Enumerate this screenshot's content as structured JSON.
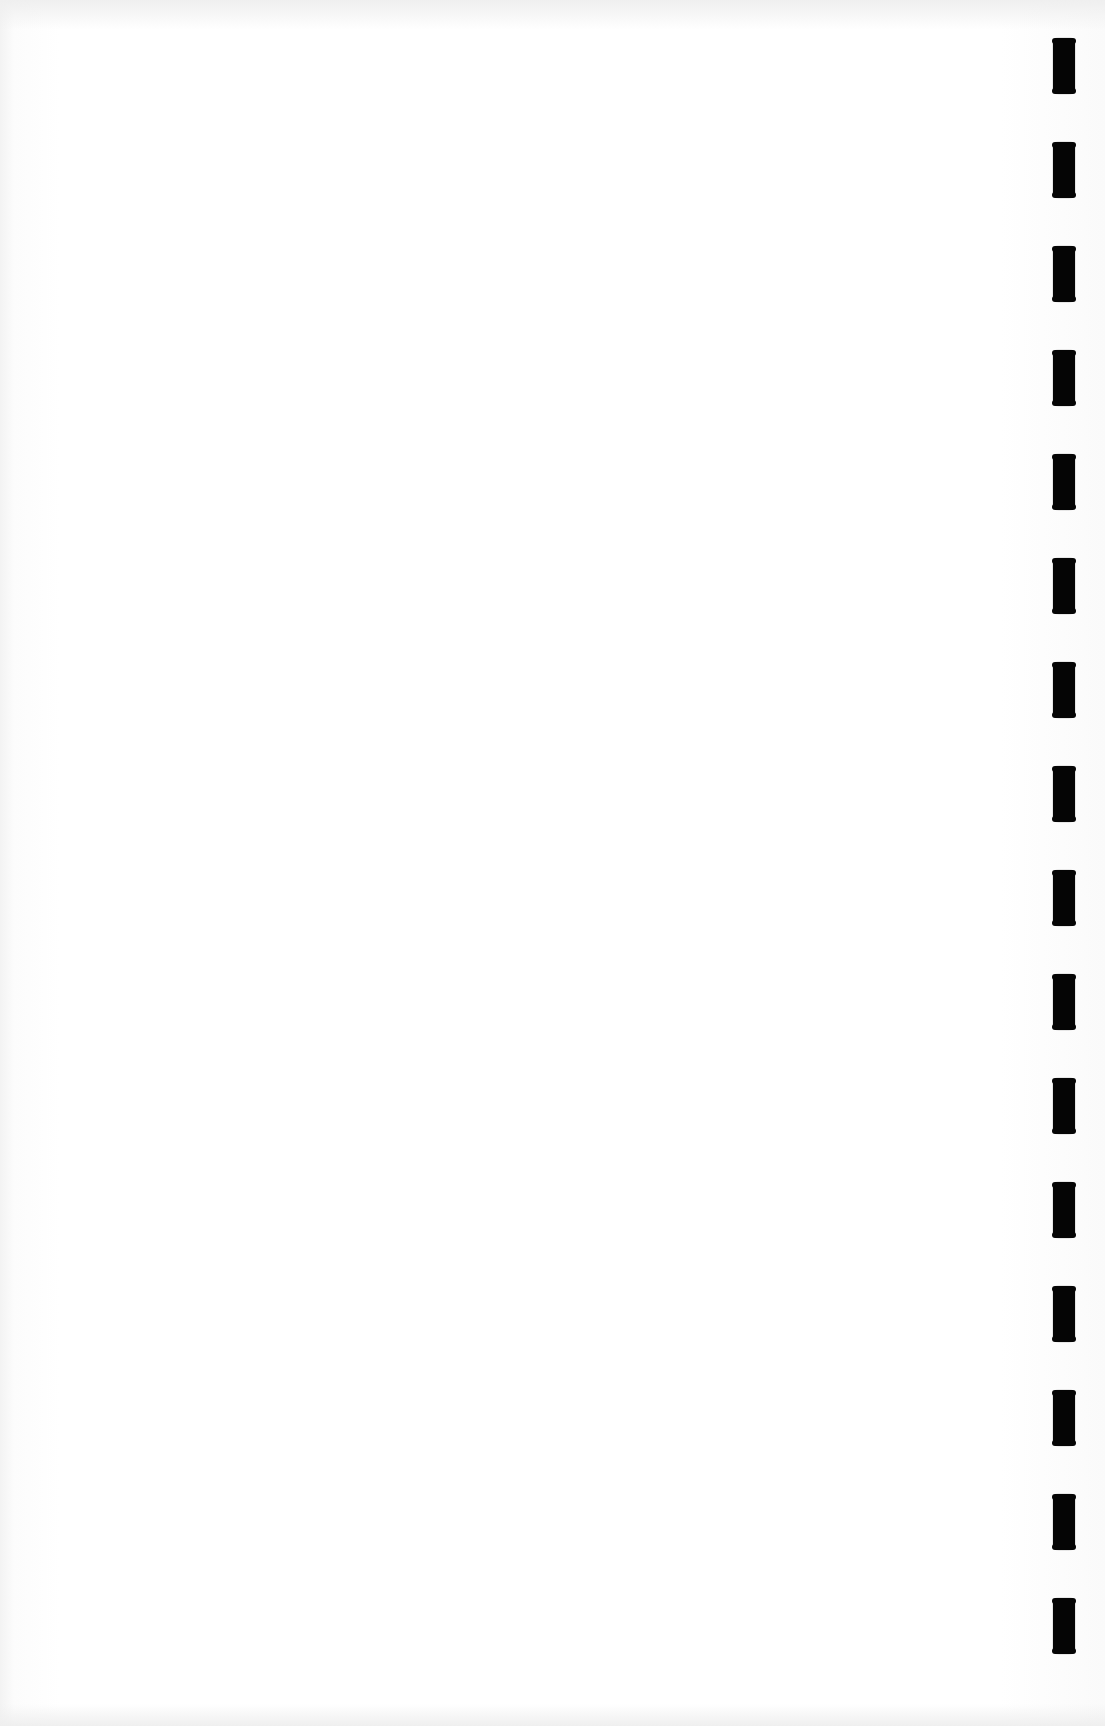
{
  "document": {
    "type": "blank scanned page",
    "text": "",
    "background_color": "#ffffff",
    "binding": {
      "side": "right",
      "hole_count": 16,
      "hole_color": "#050505",
      "holes": [
        {
          "top": 38
        },
        {
          "top": 142
        },
        {
          "top": 246
        },
        {
          "top": 350
        },
        {
          "top": 454
        },
        {
          "top": 558
        },
        {
          "top": 662
        },
        {
          "top": 766
        },
        {
          "top": 870
        },
        {
          "top": 974
        },
        {
          "top": 1078
        },
        {
          "top": 1182
        },
        {
          "top": 1286
        },
        {
          "top": 1390
        },
        {
          "top": 1494
        },
        {
          "top": 1598
        }
      ]
    }
  }
}
